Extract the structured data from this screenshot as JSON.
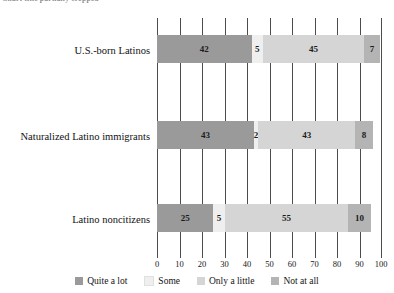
{
  "caption": {
    "cropped_top_text": "Chart title partially cropped"
  },
  "chart_data": {
    "type": "bar",
    "orientation": "horizontal",
    "stacked": true,
    "title": "",
    "xlabel": "",
    "ylabel": "",
    "xlim": [
      0,
      100
    ],
    "grid": true,
    "legend_position": "bottom",
    "categories": [
      "U.S.-born Latinos",
      "Naturalized Latino immigrants",
      "Latino noncitizens"
    ],
    "tick_labels": [
      "0",
      "10",
      "20",
      "30",
      "40",
      "50",
      "60",
      "70",
      "80",
      "90",
      "100"
    ],
    "tick_values": [
      0,
      10,
      20,
      30,
      40,
      50,
      60,
      70,
      80,
      90,
      100
    ],
    "series": [
      {
        "name": "Quite a lot",
        "color": "#9a9a9a",
        "values": [
          42,
          43,
          25
        ]
      },
      {
        "name": "Some",
        "color": "#efefef",
        "values": [
          5,
          2,
          5
        ]
      },
      {
        "name": "Only a little",
        "color": "#d5d5d5",
        "values": [
          45,
          43,
          55
        ]
      },
      {
        "name": "Not at all",
        "color": "#b4b4b4",
        "values": [
          7,
          8,
          10
        ]
      }
    ],
    "rows": [
      {
        "category": "U.S.-born Latinos",
        "segments": [
          {
            "label": "Quite a lot",
            "value": 42
          },
          {
            "label": "Some",
            "value": 5
          },
          {
            "label": "Only a little",
            "value": 45
          },
          {
            "label": "Not at all",
            "value": 7
          }
        ]
      },
      {
        "category": "Naturalized Latino immigrants",
        "segments": [
          {
            "label": "Quite a lot",
            "value": 43
          },
          {
            "label": "Some",
            "value": 2
          },
          {
            "label": "Only a little",
            "value": 43
          },
          {
            "label": "Not at all",
            "value": 8
          }
        ]
      },
      {
        "category": "Latino noncitizens",
        "segments": [
          {
            "label": "Quite a lot",
            "value": 25
          },
          {
            "label": "Some",
            "value": 5
          },
          {
            "label": "Only a little",
            "value": 55
          },
          {
            "label": "Not at all",
            "value": 10
          }
        ]
      }
    ]
  },
  "legend": {
    "items": [
      {
        "label": "Quite a lot",
        "color": "#9a9a9a"
      },
      {
        "label": "Some",
        "color": "#efefef"
      },
      {
        "label": "Only a little",
        "color": "#d5d5d5"
      },
      {
        "label": "Not at all",
        "color": "#b4b4b4"
      }
    ]
  }
}
